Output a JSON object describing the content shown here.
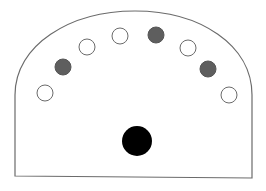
{
  "diagram": {
    "outline": {
      "stroke": "#6b6b6b",
      "fill": "#ffffff",
      "shape": "arched-rectangle"
    },
    "small_circles": [
      {
        "cx": 45,
        "cy": 93,
        "r": 8,
        "state": "open",
        "fill": "#ffffff",
        "stroke": "#6b6b6b"
      },
      {
        "cx": 63,
        "cy": 67,
        "r": 8,
        "state": "filled",
        "fill": "#5e5e5e",
        "stroke": "#555555"
      },
      {
        "cx": 87,
        "cy": 47,
        "r": 8,
        "state": "open",
        "fill": "#ffffff",
        "stroke": "#6b6b6b"
      },
      {
        "cx": 120,
        "cy": 36,
        "r": 8,
        "state": "open",
        "fill": "#ffffff",
        "stroke": "#6b6b6b"
      },
      {
        "cx": 156,
        "cy": 35,
        "r": 8,
        "state": "filled",
        "fill": "#5e5e5e",
        "stroke": "#555555"
      },
      {
        "cx": 188,
        "cy": 48,
        "r": 8,
        "state": "open",
        "fill": "#ffffff",
        "stroke": "#6b6b6b"
      },
      {
        "cx": 208,
        "cy": 69,
        "r": 8,
        "state": "filled",
        "fill": "#5e5e5e",
        "stroke": "#555555"
      },
      {
        "cx": 229,
        "cy": 95,
        "r": 8,
        "state": "open",
        "fill": "#ffffff",
        "stroke": "#6b6b6b"
      }
    ],
    "center_circle": {
      "cx": 137,
      "cy": 141,
      "r": 15,
      "fill": "#000000"
    }
  }
}
